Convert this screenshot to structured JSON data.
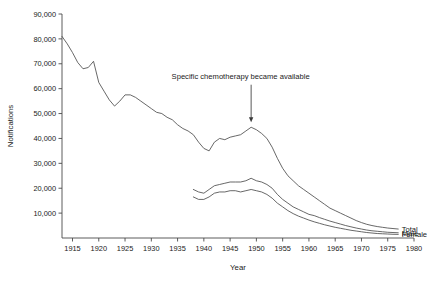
{
  "chart_data": {
    "type": "line",
    "title": "",
    "xlabel": "Year",
    "ylabel": "Notifications",
    "xlim": [
      1913,
      1980
    ],
    "ylim": [
      0,
      90000
    ],
    "grid": false,
    "legend_position": "right-end-of-line",
    "x_ticks": [
      1915,
      1920,
      1925,
      1930,
      1935,
      1940,
      1945,
      1950,
      1955,
      1960,
      1965,
      1970,
      1975,
      1980
    ],
    "x_tick_labels": [
      "1915",
      "1920",
      "1925",
      "1930",
      "1935",
      "1940",
      "1945",
      "1950",
      "1955",
      "1960",
      "1965",
      "1970",
      "1975",
      "1980"
    ],
    "y_ticks": [
      10000,
      20000,
      30000,
      40000,
      50000,
      60000,
      70000,
      80000,
      90000
    ],
    "y_tick_labels": [
      "10,000",
      "20,000",
      "30,000",
      "40,000",
      "50,000",
      "60,000",
      "70,000",
      "80,000",
      "90,000"
    ],
    "annotations": [
      {
        "text": "Specific chemotherapy became available",
        "text_x": 1947,
        "text_y": 64000,
        "arrow_to_x": 1949,
        "arrow_to_y": 46500
      }
    ],
    "series": [
      {
        "name": "Total",
        "label": "Total",
        "color": "#4d4d4d",
        "x": [
          1913,
          1914,
          1915,
          1916,
          1917,
          1918,
          1919,
          1920,
          1921,
          1922,
          1923,
          1924,
          1925,
          1926,
          1927,
          1928,
          1929,
          1930,
          1931,
          1932,
          1933,
          1934,
          1935,
          1936,
          1937,
          1938,
          1939,
          1940,
          1941,
          1942,
          1943,
          1944,
          1945,
          1946,
          1947,
          1948,
          1949,
          1950,
          1951,
          1952,
          1953,
          1954,
          1955,
          1956,
          1957,
          1958,
          1959,
          1960,
          1961,
          1962,
          1963,
          1964,
          1965,
          1966,
          1967,
          1968,
          1969,
          1970,
          1971,
          1972,
          1973,
          1974,
          1975,
          1976,
          1977
        ],
        "values": [
          81000,
          78000,
          74500,
          70500,
          68000,
          68500,
          71000,
          62500,
          59000,
          55500,
          53000,
          55000,
          57500,
          57500,
          56500,
          55000,
          53500,
          52000,
          50500,
          50000,
          48500,
          47500,
          45500,
          44000,
          43000,
          41500,
          38500,
          36000,
          35000,
          38500,
          40000,
          39500,
          40500,
          41000,
          41500,
          43000,
          44500,
          43500,
          42000,
          40000,
          36500,
          32000,
          28000,
          25000,
          23000,
          21000,
          19500,
          18000,
          16500,
          15000,
          13500,
          12000,
          11000,
          10000,
          9000,
          8000,
          7000,
          6200,
          5500,
          5000,
          4600,
          4300,
          4000,
          3800,
          3600
        ]
      },
      {
        "name": "Male",
        "label": "Male",
        "color": "#4d4d4d",
        "x": [
          1938,
          1939,
          1940,
          1941,
          1942,
          1943,
          1944,
          1945,
          1946,
          1947,
          1948,
          1949,
          1950,
          1951,
          1952,
          1953,
          1954,
          1955,
          1956,
          1957,
          1958,
          1959,
          1960,
          1961,
          1962,
          1963,
          1964,
          1965,
          1966,
          1967,
          1968,
          1969,
          1970,
          1971,
          1972,
          1973,
          1974,
          1975,
          1976,
          1977
        ],
        "values": [
          19500,
          18500,
          18000,
          19500,
          21000,
          21500,
          22000,
          22500,
          22500,
          22500,
          23000,
          24000,
          23000,
          22500,
          21500,
          20000,
          17500,
          15500,
          14000,
          12500,
          11500,
          10500,
          9500,
          9000,
          8200,
          7500,
          6800,
          6200,
          5600,
          5000,
          4500,
          4000,
          3600,
          3200,
          2900,
          2700,
          2500,
          2300,
          2200,
          2100
        ]
      },
      {
        "name": "Female",
        "label": "Female",
        "color": "#4d4d4d",
        "x": [
          1938,
          1939,
          1940,
          1941,
          1942,
          1943,
          1944,
          1945,
          1946,
          1947,
          1948,
          1949,
          1950,
          1951,
          1952,
          1953,
          1954,
          1955,
          1956,
          1957,
          1958,
          1959,
          1960,
          1961,
          1962,
          1963,
          1964,
          1965,
          1966,
          1967,
          1968,
          1969,
          1970,
          1971,
          1972,
          1973,
          1974,
          1975,
          1976,
          1977
        ],
        "values": [
          16500,
          15500,
          15500,
          16500,
          18000,
          18500,
          18500,
          19000,
          19000,
          18500,
          19000,
          19500,
          19000,
          18500,
          17500,
          16000,
          14000,
          12500,
          11000,
          9800,
          8800,
          8000,
          7200,
          6500,
          5900,
          5300,
          4800,
          4300,
          3900,
          3500,
          3100,
          2800,
          2500,
          2200,
          2000,
          1800,
          1700,
          1600,
          1500,
          1450
        ]
      }
    ]
  }
}
